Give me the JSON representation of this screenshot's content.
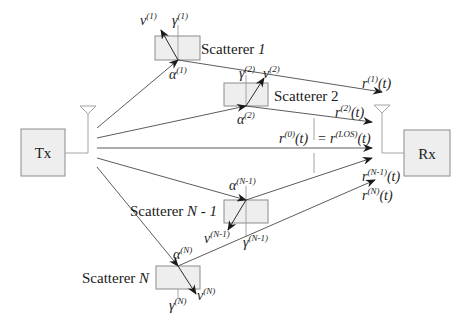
{
  "diagram": {
    "transmitter": {
      "label": "Tx"
    },
    "receiver": {
      "label": "Rx"
    },
    "scatterers": [
      {
        "name": "Scatterer",
        "index": "1",
        "velocity": "v",
        "velocity_sup": "(1)",
        "gamma": "γ",
        "gamma_sup": "(1)",
        "alpha": "α",
        "alpha_sup": "(1)",
        "signal": "r",
        "signal_sup": "(1)",
        "signal_arg": "(t)"
      },
      {
        "name": "Scatterer",
        "index": "2",
        "velocity": "v",
        "velocity_sup": "(2)",
        "gamma": "γ",
        "gamma_sup": "(2)",
        "alpha": "α",
        "alpha_sup": "(2)",
        "signal": "r",
        "signal_sup": "(2)",
        "signal_arg": "(t)"
      },
      {
        "name": "Scatterer",
        "index": "N - 1",
        "velocity": "v",
        "velocity_sup": "(N-1)",
        "gamma": "γ",
        "gamma_sup": "(N-1)",
        "alpha": "α",
        "alpha_sup": "(N-1)",
        "signal": "r",
        "signal_sup": "(N-1)",
        "signal_arg": "(t)"
      },
      {
        "name": "Scatterer",
        "index": "N",
        "velocity": "v",
        "velocity_sup": "(N)",
        "gamma": "γ",
        "gamma_sup": "(N)",
        "alpha": "α",
        "alpha_sup": "(N)",
        "signal": "r",
        "signal_sup": "(N)",
        "signal_arg": "(t)"
      }
    ],
    "los": {
      "signal": "r",
      "signal_sup": "(0)",
      "signal_arg": "(t)",
      "equals": "=",
      "los_signal": "r",
      "los_sup": "(LOS)",
      "los_arg": "(t)"
    }
  }
}
